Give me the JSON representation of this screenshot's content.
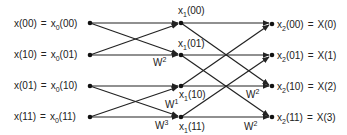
{
  "diagram": {
    "title": "",
    "type": "FFT butterfly flow graph (4-point, radix-2)",
    "inputs": [
      {
        "lhs": "x(00)",
        "var": "x",
        "sub": "0",
        "idx": "(00)"
      },
      {
        "lhs": "x(10)",
        "var": "x",
        "sub": "0",
        "idx": "(01)"
      },
      {
        "lhs": "x(01)",
        "var": "x",
        "sub": "0",
        "idx": "(10)"
      },
      {
        "lhs": "x(11)",
        "var": "x",
        "sub": "0",
        "idx": "(11)"
      }
    ],
    "middle": [
      {
        "var": "x",
        "sub": "1",
        "idx": "(00)"
      },
      {
        "var": "x",
        "sub": "1",
        "idx": "(01)"
      },
      {
        "var": "x",
        "sub": "1",
        "idx": "(10)"
      },
      {
        "var": "x",
        "sub": "1",
        "idx": "(11)"
      }
    ],
    "outputs": [
      {
        "var": "x",
        "sub": "2",
        "idx": "(00)",
        "rhs": "X(0)"
      },
      {
        "var": "x",
        "sub": "2",
        "idx": "(01)",
        "rhs": "X(1)"
      },
      {
        "var": "x",
        "sub": "2",
        "idx": "(10)",
        "rhs": "X(2)"
      },
      {
        "var": "x",
        "sub": "2",
        "idx": "(11)",
        "rhs": "X(3)"
      }
    ],
    "weights": {
      "stage1": [
        {
          "base": "W",
          "exp": "2",
          "node": "x1(01)"
        },
        {
          "base": "W",
          "exp": "1",
          "node": "x1(10)"
        },
        {
          "base": "W",
          "exp": "3",
          "node": "x1(11)"
        }
      ],
      "stage2": [
        {
          "base": "W",
          "exp": "2",
          "node": "x2(10)"
        },
        {
          "base": "W",
          "exp": "2",
          "node": "x2(11)"
        }
      ]
    },
    "equals": "="
  }
}
